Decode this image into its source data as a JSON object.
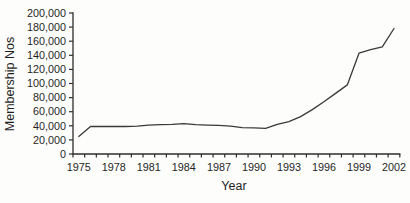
{
  "chart_data": {
    "type": "line",
    "title": "",
    "xlabel": "Year",
    "ylabel": "Membership Nos",
    "x": [
      1975,
      1976,
      1977,
      1978,
      1979,
      1980,
      1981,
      1982,
      1983,
      1984,
      1985,
      1986,
      1987,
      1988,
      1989,
      1990,
      1991,
      1992,
      1993,
      1994,
      1995,
      1996,
      1997,
      1998,
      1999,
      2000,
      2001,
      2002
    ],
    "values": [
      25000,
      39000,
      39000,
      39000,
      39000,
      39500,
      41000,
      41500,
      42000,
      43000,
      41500,
      41000,
      40500,
      39500,
      37500,
      37000,
      36500,
      42000,
      46000,
      53000,
      63000,
      74000,
      86000,
      98000,
      143000,
      148000,
      152000,
      178000
    ],
    "x_tick_labels": [
      "1975",
      "1978",
      "1981",
      "1984",
      "1987",
      "1990",
      "1993",
      "1996",
      "1999",
      "2002"
    ],
    "y_ticks": [
      0,
      20000,
      40000,
      60000,
      80000,
      100000,
      120000,
      140000,
      160000,
      180000,
      200000
    ],
    "y_tick_labels": [
      "0",
      "20,000",
      "40,000",
      "60,000",
      "80,000",
      "100,000",
      "120,000",
      "140,000",
      "160,000",
      "180,000",
      "200,000"
    ],
    "ylim": [
      0,
      200000
    ],
    "grid": false,
    "legend": "none",
    "line_color": "#3a3a3a",
    "axis_color": "#2f2f2f",
    "text_color": "#1f1f1f",
    "background_color": "#fdfdfc"
  }
}
